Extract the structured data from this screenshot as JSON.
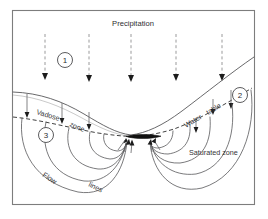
{
  "figure": {
    "name": "groundwater-flow-diagram",
    "title_label": "Precipitation",
    "frame": {
      "x": 12,
      "y": 10,
      "width": 243,
      "height": 195
    },
    "colors": {
      "background": "#ffffff",
      "frame_stroke": "#7d7d7d",
      "terrain_stroke": "#58585a",
      "flowline_stroke": "#58585a",
      "watertable_stroke": "#2b2b2b",
      "precipitation_stroke": "#8e8e90",
      "stream_fill": "#111111",
      "text_fill": "#2e2e30"
    }
  },
  "labels": {
    "precipitation": "Precipitation",
    "vadose_word_1": "Vadose",
    "vadose_word_2": "zone",
    "water_table_word_1": "Water",
    "water_table_word_2": "table",
    "saturated_zone": "Saturated zone",
    "flow_word_1": "Flow",
    "flow_word_2": "lines"
  },
  "callouts": [
    {
      "id": "callout-1",
      "number": "1",
      "cx": 65,
      "cy": 60,
      "r": 7.5
    },
    {
      "id": "callout-2",
      "number": "2",
      "cx": 240,
      "cy": 95,
      "r": 7.5
    },
    {
      "id": "callout-3",
      "number": "3",
      "cx": 46,
      "cy": 135,
      "r": 7.5
    }
  ],
  "precipitation_arrows": [
    {
      "x": 45,
      "y_top": 34,
      "y_bottom": 78
    },
    {
      "x": 89,
      "y_top": 34,
      "y_bottom": 80
    },
    {
      "x": 131,
      "y_top": 34,
      "y_bottom": 80
    },
    {
      "x": 176,
      "y_top": 34,
      "y_bottom": 79
    },
    {
      "x": 222,
      "y_top": 34,
      "y_bottom": 79
    }
  ],
  "infiltration_arrows": [
    {
      "x": 26,
      "y_top": 96,
      "y_bottom": 118
    },
    {
      "x": 62,
      "y_top": 101,
      "y_bottom": 123
    },
    {
      "x": 89,
      "y_top": 110,
      "y_bottom": 128
    },
    {
      "x": 58,
      "y_top": 103,
      "y_bottom": 117
    },
    {
      "x": 196,
      "y_top": 116,
      "y_bottom": 131
    },
    {
      "x": 213,
      "y_top": 98,
      "y_bottom": 115
    },
    {
      "x": 231,
      "y_top": 92,
      "y_bottom": 110
    }
  ],
  "stream": {
    "x1": 126,
    "x2": 161,
    "y": 136,
    "thickness": 3.4
  },
  "zones": {
    "vadose": "unsaturated zone above water table",
    "saturated": "zone below water table"
  }
}
